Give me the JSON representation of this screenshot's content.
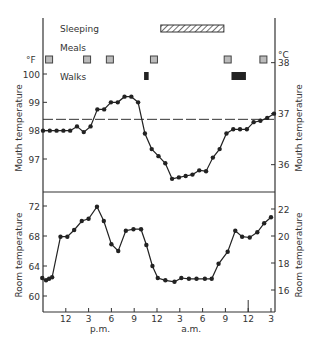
{
  "chart_data": [
    {
      "type": "line",
      "title": "Mouth temperature",
      "ylabel": "Mouth temperature",
      "ylabel_right": "Mouth temperature",
      "left_unit": "°F",
      "right_unit": "°C",
      "yticks_left": [
        100,
        99,
        98,
        97
      ],
      "yticks_right": [
        38,
        37,
        36
      ],
      "ylim_F": [
        95.3,
        100.0
      ],
      "reference_line_F": 98.4,
      "reference_line_style": "dashed",
      "x_hours": [
        0,
        1,
        2,
        3,
        4,
        5,
        6,
        7,
        8,
        9,
        10,
        11,
        12,
        13,
        14,
        15,
        16,
        17,
        18,
        19,
        20,
        21,
        22,
        23,
        24,
        25,
        26,
        27,
        28,
        29,
        30,
        31,
        32,
        33,
        34,
        35,
        36
      ],
      "values": [
        98.0,
        98.0,
        98.0,
        98.0,
        98.0,
        98.15,
        97.95,
        98.15,
        98.75,
        98.75,
        99.0,
        99.0,
        99.2,
        99.2,
        99.0,
        97.9,
        97.35,
        97.1,
        96.85,
        96.3,
        96.35,
        96.4,
        96.45,
        96.6,
        96.57,
        97.05,
        97.35,
        97.9,
        98.05,
        98.05,
        98.05,
        98.3,
        98.35,
        98.45,
        98.6
      ],
      "activities": {
        "sleeping": [
          {
            "start": 15.5,
            "end": 23.8
          }
        ],
        "meals": [
          0.8,
          5.8,
          8.8,
          14.6,
          24.3,
          29.0
        ],
        "walks": [
          {
            "start": 13.3,
            "end": 13.9
          },
          {
            "start": 24.8,
            "end": 26.7
          }
        ]
      }
    },
    {
      "type": "line",
      "title": "Room temperature",
      "ylabel": "Room temperature",
      "ylabel_right": "Room temperature",
      "yticks_left": [
        72,
        68,
        64,
        60
      ],
      "yticks_right": [
        22,
        20,
        18,
        16
      ],
      "ylim_F": [
        58.0,
        74.0
      ],
      "x_hours": [
        -0.1,
        0.4,
        0.8,
        1.2,
        2.3,
        3.2,
        4.1,
        5.1,
        6.0,
        7.1,
        8.0,
        9.0,
        9.9,
        10.9,
        11.9,
        12.9,
        13.6,
        14.4,
        15.1,
        16.1,
        17.3,
        18.2,
        19.2,
        20.2,
        21.3,
        22.2,
        23.1,
        24.3,
        25.3,
        26.2,
        27.2,
        28.2,
        29.1,
        30.0
      ],
      "values": [
        62.4,
        62.1,
        62.3,
        62.5,
        67.9,
        67.9,
        68.8,
        70.0,
        70.3,
        71.9,
        70.0,
        66.9,
        66.0,
        68.7,
        68.9,
        68.9,
        66.8,
        64.0,
        62.4,
        62.1,
        61.9,
        62.4,
        62.3,
        62.3,
        62.3,
        62.3,
        64.3,
        65.9,
        68.7,
        67.9,
        67.8,
        68.5,
        69.7,
        70.5
      ],
      "x_tick_labels": [
        "12",
        "3",
        "6",
        "9",
        "12",
        "3",
        "6",
        "9",
        "12",
        "3"
      ],
      "x_tick_hours": [
        3,
        6,
        9,
        12,
        15,
        18,
        21,
        24,
        27,
        30
      ],
      "x_period_labels": [
        {
          "label": "p.m.",
          "hour": 7.5
        },
        {
          "label": "a.m.",
          "hour": 19.5
        }
      ]
    }
  ],
  "labels": {
    "sleeping": "Sleeping",
    "meals": "Meals",
    "walks": "Walks",
    "unit_f": "°F",
    "unit_c": "°C",
    "upper_ylabel_left": "Mouth temperature",
    "upper_ylabel_right": "Mouth temperature",
    "lower_ylabel_left": "Room temperature",
    "lower_ylabel_right": "Room temperature",
    "pm": "p.m.",
    "am": "a.m."
  }
}
